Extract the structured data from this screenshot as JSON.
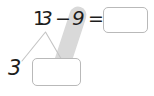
{
  "worksheet": {
    "equation": {
      "minuend_tens_digit": "1",
      "minuend_ones_digit": "3",
      "minuend": "13",
      "minus_sign": "−",
      "subtrahend": "9",
      "equals_sign": "=",
      "answer_value": ""
    },
    "number_bond": {
      "whole_label": "3",
      "known_part": "3",
      "unknown_part_value": ""
    },
    "colors": {
      "ink": "#1d1d1d",
      "box_border": "#b9b9b9",
      "highlighter": "#d8d8d8",
      "bond_line": "#c4c4c4",
      "background": "#ffffff"
    },
    "icons": {
      "highlighter_stroke": "highlighter-stroke-icon",
      "bond_branches": "number-bond-branches-icon"
    }
  }
}
